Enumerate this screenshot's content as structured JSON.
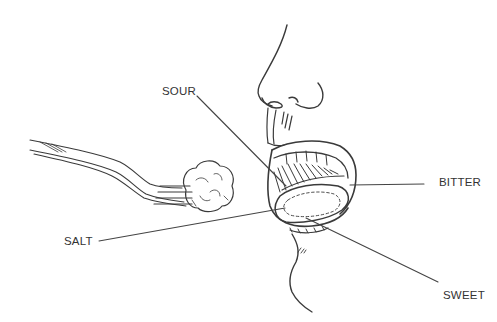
{
  "diagram": {
    "labels": {
      "sour": "SOUR",
      "bitter": "BITTER",
      "salt": "SALT",
      "sweet": "SWEET"
    },
    "colors": {
      "ink": "#3a3a3a",
      "leader_line": "#444444",
      "background": "#ffffff"
    }
  }
}
